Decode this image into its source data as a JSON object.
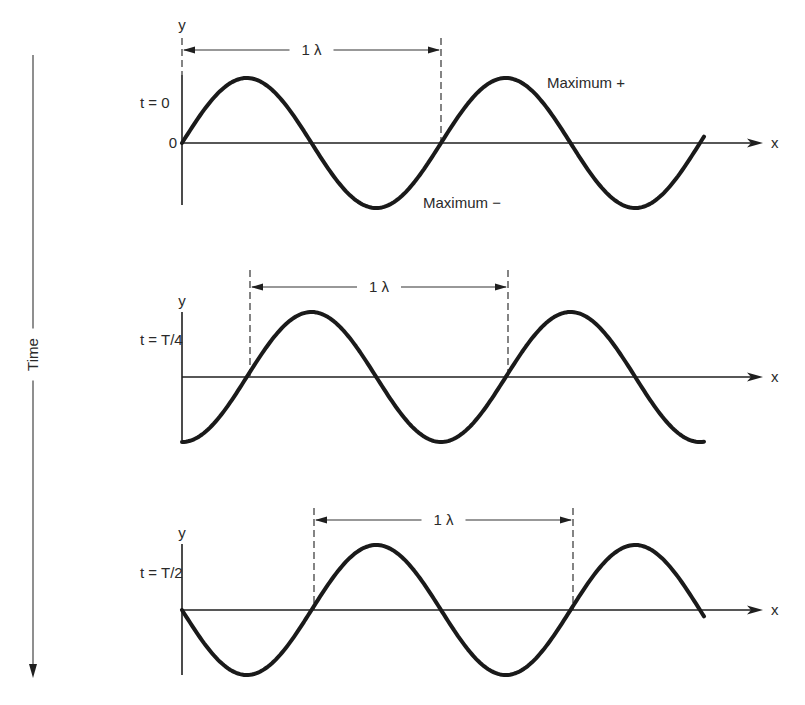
{
  "figure": {
    "time_axis": {
      "label": "Time",
      "x": 33,
      "y_top": 55,
      "y_bottom": 678
    },
    "panels": [
      {
        "id": "t0",
        "time_label": "t = 0",
        "y_axis_label": "y",
        "x_axis_label": "x",
        "origin_label": "0",
        "wavelength_label": "1 λ",
        "annotations": [
          {
            "text": "Maximum +",
            "x": 547,
            "y": 88
          },
          {
            "text": "Maximum −",
            "x": 423,
            "y": 208
          }
        ],
        "baseline_y": 143,
        "axis_top": 75,
        "axis_bottom": 205,
        "phase_deg": 0,
        "dash_left_x": 182,
        "dash_right_x": 441,
        "dash_top": 38,
        "dim_y": 50
      },
      {
        "id": "tT4",
        "time_label": "t = T/4",
        "y_axis_label": "y",
        "x_axis_label": "x",
        "origin_label": "",
        "wavelength_label": "1 λ",
        "annotations": [],
        "baseline_y": 377,
        "axis_top": 312,
        "axis_bottom": 440,
        "phase_deg": 90,
        "dash_left_x": 250,
        "dash_right_x": 508,
        "dash_top": 270,
        "dim_y": 287
      },
      {
        "id": "tT2",
        "time_label": "t = T/2",
        "y_axis_label": "y",
        "x_axis_label": "x",
        "origin_label": "",
        "wavelength_label": "1 λ",
        "annotations": [],
        "baseline_y": 610,
        "axis_top": 544,
        "axis_bottom": 675,
        "phase_deg": 180,
        "dash_left_x": 314,
        "dash_right_x": 573,
        "dash_top": 508,
        "dim_y": 520
      }
    ],
    "wave": {
      "x_start": 182,
      "x_end": 705,
      "wavelength_px": 259,
      "amplitude_px": 65
    },
    "axis": {
      "x_start": 182,
      "x_arrow_tip": 763,
      "x_label_x": 771
    },
    "colors": {
      "ink": "#1a1a1a",
      "background": "#ffffff"
    }
  }
}
